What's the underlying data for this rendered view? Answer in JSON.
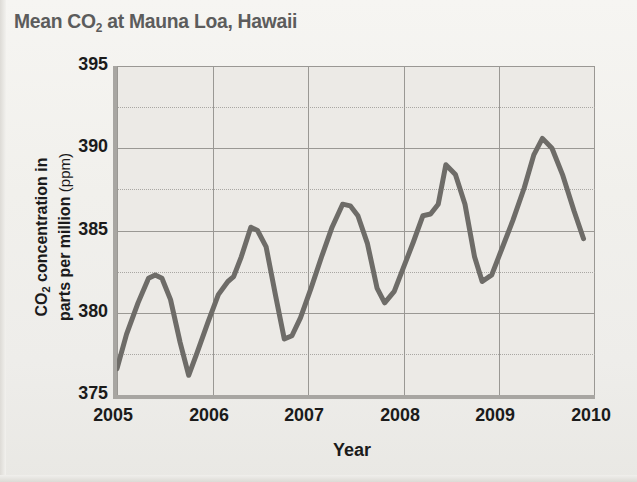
{
  "chart_data": {
    "type": "line",
    "title": "Mean CO2 at Mauna Loa, Hawaii",
    "title_main": "Mean CO",
    "title_sub": "2",
    "title_rest": " at Mauna Loa, Hawaii",
    "xlabel": "Year",
    "ylabel_line1_main": "CO",
    "ylabel_line1_sub": "2",
    "ylabel_line1_rest": " concentration in",
    "ylabel_line2": "parts per million",
    "ylabel_unit": "(ppm)",
    "xlim": [
      2005,
      2010
    ],
    "ylim": [
      375,
      395
    ],
    "ytick_labels": [
      "395",
      "390",
      "385",
      "380",
      "375"
    ],
    "ytick_values": [
      395,
      390,
      385,
      380,
      375
    ],
    "y_minor_values": [
      392.5,
      387.5,
      382.5,
      377.5
    ],
    "xtick_labels": [
      "2005",
      "2006",
      "2007",
      "2008",
      "2009",
      "2010"
    ],
    "xtick_values": [
      2005,
      2006,
      2007,
      2008,
      2009,
      2010
    ],
    "grid": true,
    "legend": "none",
    "series_name": "Mean CO2 concentration",
    "line_color": "#6e6c68",
    "x": [
      2005.0,
      2005.1,
      2005.22,
      2005.33,
      2005.4,
      2005.47,
      2005.56,
      2005.66,
      2005.75,
      2005.84,
      2005.95,
      2006.06,
      2006.16,
      2006.22,
      2006.3,
      2006.4,
      2006.47,
      2006.56,
      2006.66,
      2006.75,
      2006.83,
      2006.92,
      2007.03,
      2007.14,
      2007.25,
      2007.36,
      2007.44,
      2007.52,
      2007.62,
      2007.72,
      2007.8,
      2007.9,
      2008.0,
      2008.1,
      2008.2,
      2008.28,
      2008.36,
      2008.44,
      2008.54,
      2008.64,
      2008.74,
      2008.82,
      2008.92,
      2009.02,
      2009.14,
      2009.26,
      2009.36,
      2009.45,
      2009.55,
      2009.66,
      2009.78,
      2009.88
    ],
    "y": [
      376.6,
      378.7,
      380.6,
      382.1,
      382.3,
      382.1,
      380.8,
      378.2,
      376.2,
      377.6,
      379.4,
      381.1,
      381.9,
      382.2,
      383.4,
      385.2,
      385.0,
      384.0,
      381.0,
      378.4,
      378.6,
      379.7,
      381.5,
      383.4,
      385.2,
      386.6,
      386.5,
      385.9,
      384.2,
      381.5,
      380.6,
      381.3,
      382.8,
      384.3,
      385.9,
      386.0,
      386.6,
      389.0,
      388.4,
      386.6,
      383.4,
      381.9,
      382.3,
      383.8,
      385.6,
      387.6,
      389.6,
      390.6,
      390.0,
      388.4,
      386.2,
      384.5
    ]
  }
}
